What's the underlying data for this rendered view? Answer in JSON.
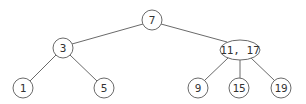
{
  "diagram": {
    "type": "2-3 tree",
    "stroke_color": "#6a6a6a",
    "text_color": "#333333",
    "nodes": [
      {
        "id": "n7",
        "label": "7",
        "shape": "circle",
        "cx": 152,
        "cy": 20,
        "r": 10
      },
      {
        "id": "n3",
        "label": "3",
        "shape": "circle",
        "cx": 63,
        "cy": 48,
        "r": 10
      },
      {
        "id": "n1117",
        "label": "11, 17",
        "shape": "ellipse",
        "cx": 240,
        "cy": 50,
        "rx": 20,
        "ry": 10
      },
      {
        "id": "n1",
        "label": "1",
        "shape": "circle",
        "cx": 23,
        "cy": 88,
        "r": 10
      },
      {
        "id": "n5",
        "label": "5",
        "shape": "circle",
        "cx": 104,
        "cy": 88,
        "r": 10
      },
      {
        "id": "n9",
        "label": "9",
        "shape": "circle",
        "cx": 198,
        "cy": 88,
        "r": 10
      },
      {
        "id": "n15",
        "label": "15",
        "shape": "circle",
        "cx": 239,
        "cy": 88,
        "r": 10
      },
      {
        "id": "n19",
        "label": "19",
        "shape": "circle",
        "cx": 281,
        "cy": 88,
        "r": 10
      }
    ],
    "edges": [
      {
        "from": "n7",
        "to": "n3",
        "x1": 143,
        "y1": 24,
        "x2": 72,
        "y2": 44
      },
      {
        "from": "n7",
        "to": "n1117",
        "x1": 161,
        "y1": 24,
        "x2": 227,
        "y2": 42
      },
      {
        "from": "n3",
        "to": "n1",
        "x1": 56,
        "y1": 55,
        "x2": 30,
        "y2": 81
      },
      {
        "from": "n3",
        "to": "n5",
        "x1": 70,
        "y1": 55,
        "x2": 97,
        "y2": 81
      },
      {
        "from": "n1117",
        "to": "n9",
        "x1": 228,
        "y1": 58,
        "x2": 205,
        "y2": 80
      },
      {
        "from": "n1117",
        "to": "n15",
        "x1": 240,
        "y1": 60,
        "x2": 240,
        "y2": 78
      },
      {
        "from": "n1117",
        "to": "n19",
        "x1": 251,
        "y1": 58,
        "x2": 274,
        "y2": 80
      }
    ]
  }
}
